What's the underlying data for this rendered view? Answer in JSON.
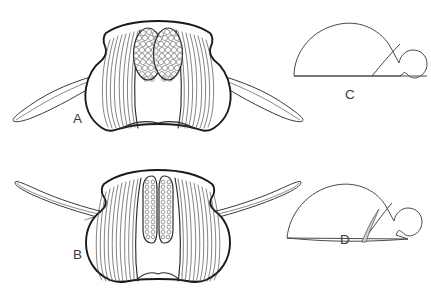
{
  "figure": {
    "background_color": "#ffffff",
    "ink_color": "#1a1a1a",
    "shade_color": "#cfcfcf",
    "panels": [
      {
        "id": "A",
        "label": "A",
        "label_x": 73,
        "label_y": 123,
        "view": "anterior head capsule with broad oval compound eyes",
        "eye_shape": "broad-oval",
        "eye_count": 2,
        "facet_pattern": "hexagonal",
        "striation_count": 18,
        "appendages": 2,
        "appendage_type": "elongate blade-like lateral appendage"
      },
      {
        "id": "B",
        "label": "B",
        "label_x": 73,
        "label_y": 259,
        "view": "anterior head capsule with narrow elongate compound eyes",
        "eye_shape": "narrow-elongate",
        "eye_count": 2,
        "facet_pattern": "small-rows",
        "striation_count": 26,
        "appendages": 2,
        "appendage_type": "elongate blade-like lateral appendage"
      },
      {
        "id": "C",
        "label": "C",
        "label_x": 345,
        "label_y": 99,
        "view": "lateral profile, dome with posterior lobe",
        "has_shaded_wedge": false
      },
      {
        "id": "D",
        "label": "D",
        "label_x": 340,
        "label_y": 244,
        "view": "lateral profile, dome with posterior lobe and shaded wedge",
        "has_shaded_wedge": true
      }
    ]
  }
}
